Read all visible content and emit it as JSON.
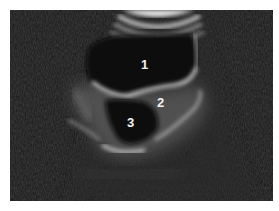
{
  "image": {
    "type": "ultrasound-scan",
    "background_color": "#1a1a1a",
    "echo_color": "#d8d8d8"
  },
  "labels": [
    {
      "text": "1",
      "x": 141,
      "y": 58
    },
    {
      "text": "2",
      "x": 157,
      "y": 96
    },
    {
      "text": "3",
      "x": 127,
      "y": 116
    }
  ]
}
